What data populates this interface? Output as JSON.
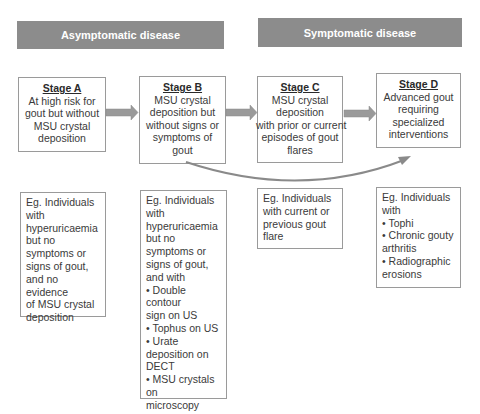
{
  "headers": [
    {
      "label": "Asymptomatic disease"
    },
    {
      "label": "Symptomatic disease"
    }
  ],
  "stages": [
    {
      "title": "Stage A",
      "description": [
        "At high risk for",
        "gout but without",
        "MSU crystal",
        "deposition"
      ]
    },
    {
      "title": "Stage B",
      "description": [
        "MSU crystal",
        "deposition but",
        "without signs or",
        "symptoms of",
        "gout"
      ]
    },
    {
      "title": "Stage C",
      "description": [
        "MSU crystal",
        "deposition",
        "with prior or current",
        "episodes of gout",
        "flares"
      ]
    },
    {
      "title": "Stage D",
      "description": [
        "Advanced gout",
        "requiring",
        "specialized",
        "interventions"
      ]
    }
  ],
  "examples": [
    {
      "lines": [
        "Eg. Individuals",
        "with",
        "hyperuricaemia",
        "but no",
        "symptoms or",
        "signs of gout,",
        "and no evidence",
        "of MSU crystal",
        "deposition"
      ]
    },
    {
      "lines": [
        "Eg. Individuals",
        "with",
        "hyperuricaemia",
        "but no",
        "symptoms or",
        "signs of gout,",
        "and with",
        "• Double contour",
        "sign on US",
        "• Tophus on US",
        "• Urate",
        "deposition on",
        "DECT",
        "• MSU crystals on",
        "microscopy"
      ]
    },
    {
      "lines": [
        "Eg. Individuals",
        "with current or",
        "previous gout",
        "flare"
      ]
    },
    {
      "lines": [
        "Eg. Individuals",
        "with",
        "• Tophi",
        "• Chronic gouty",
        "arthritis",
        "• Radiographic",
        "erosions"
      ]
    }
  ],
  "colors": {
    "header_bg": "#8c8c8c",
    "arrow": "#9a9a9a",
    "border": "#9a9a9a"
  },
  "icons": [
    "arrow-right-icon",
    "curved-arrow-icon"
  ]
}
